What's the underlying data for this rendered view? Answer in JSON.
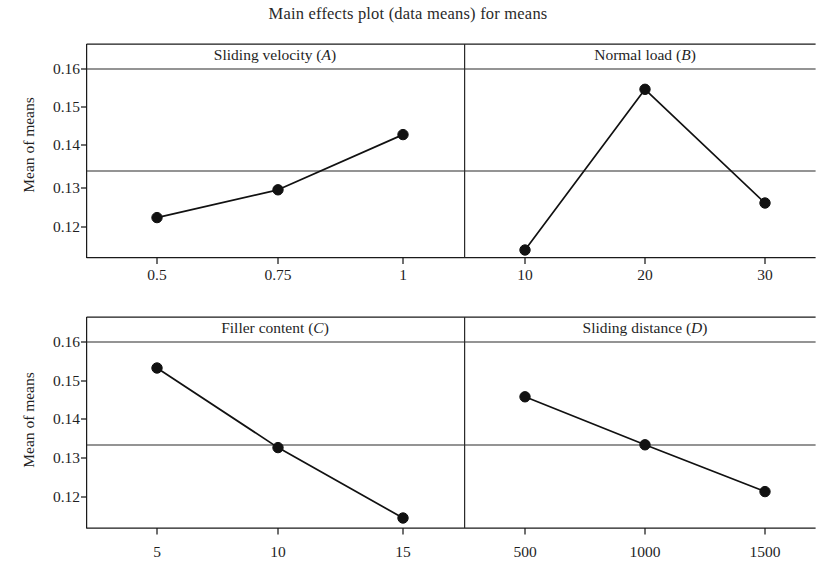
{
  "title": "Main effects plot (data means) for means",
  "y_axis_title": "Mean of means",
  "rows": [
    {
      "name": "top",
      "ytick_labels": [
        "0.16",
        "0.15",
        "0.14",
        "0.13",
        "0.12"
      ],
      "panels": [
        {
          "strip_label": "Sliding velocity (A)",
          "strip_name": "Sliding velocity",
          "factor_code": "A",
          "xtick_labels": [
            "0.5",
            "0.75",
            "1"
          ]
        },
        {
          "strip_label": "Normal load (B)",
          "strip_name": "Normal load",
          "factor_code": "B",
          "xtick_labels": [
            "10",
            "20",
            "30"
          ]
        }
      ]
    },
    {
      "name": "bottom",
      "ytick_labels": [
        "0.16",
        "0.15",
        "0.14",
        "0.13",
        "0.12"
      ],
      "panels": [
        {
          "strip_label": "Filler content (C)",
          "strip_name": "Filler content",
          "factor_code": "C",
          "xtick_labels": [
            "5",
            "10",
            "15"
          ]
        },
        {
          "strip_label": "Sliding distance (D)",
          "strip_name": "Sliding distance",
          "factor_code": "D",
          "xtick_labels": [
            "500",
            "1000",
            "1500"
          ]
        }
      ]
    }
  ],
  "chart_data": {
    "type": "line",
    "title": "Main effects plot (data means) for means",
    "subtitle": "",
    "xlabel": "",
    "ylabel": "Mean of means",
    "ylim": [
      0.1125,
      0.1625
    ],
    "yticks": [
      0.12,
      0.13,
      0.14,
      0.15,
      0.16
    ],
    "ytick_labels": [
      "0.12",
      "0.13",
      "0.14",
      "0.15",
      "0.16"
    ],
    "grid": false,
    "legend": "none",
    "reference_line": {
      "value": 0.1335,
      "label": "overall mean",
      "orientation": "horizontal"
    },
    "panels": [
      {
        "id": "A",
        "title": "Sliding velocity (A)",
        "factor": "Sliding velocity",
        "categories": [
          "0.5",
          "0.75",
          "1"
        ],
        "x": [
          0.5,
          0.75,
          1
        ],
        "values": [
          0.124,
          0.1313,
          0.1458
        ],
        "marker": "filled-circle",
        "row": 0,
        "col": 0
      },
      {
        "id": "B",
        "title": "Normal load (B)",
        "factor": "Normal load",
        "categories": [
          "10",
          "20",
          "30"
        ],
        "x": [
          10,
          20,
          30
        ],
        "values": [
          0.1155,
          0.1577,
          0.1278
        ],
        "marker": "filled-circle",
        "row": 0,
        "col": 1
      },
      {
        "id": "C",
        "title": "Filler content (C)",
        "factor": "Filler content",
        "categories": [
          "5",
          "10",
          "15"
        ],
        "x": [
          5,
          10,
          15
        ],
        "values": [
          0.1532,
          0.1328,
          0.1145
        ],
        "marker": "filled-circle",
        "row": 1,
        "col": 0
      },
      {
        "id": "D",
        "title": "Sliding distance (D)",
        "factor": "Sliding distance",
        "categories": [
          "500",
          "1000",
          "1500"
        ],
        "x": [
          500,
          1000,
          1500
        ],
        "values": [
          0.1458,
          0.1335,
          0.1215
        ],
        "marker": "filled-circle",
        "row": 1,
        "col": 1
      }
    ],
    "colors": {
      "line": "#111111",
      "marker": "#111111",
      "axis": "#1a1a1a",
      "reference_line": "#2b2b2b",
      "background": "#ffffff"
    }
  }
}
